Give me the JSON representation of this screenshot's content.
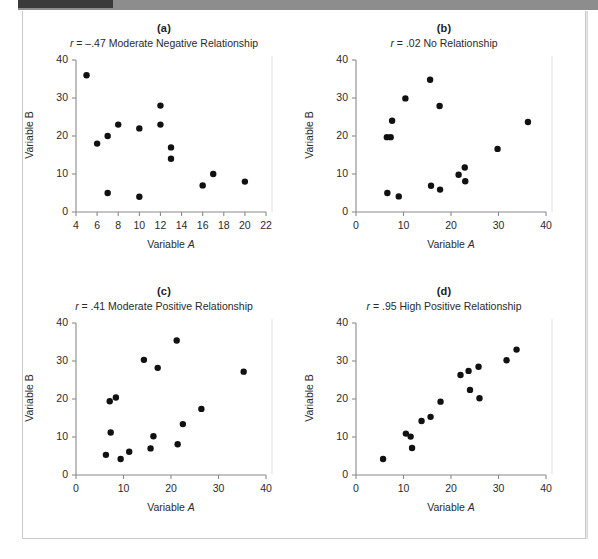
{
  "figure": {
    "panel_count": 4,
    "dot_color": "#111111",
    "axis_color": "#8a8a8a"
  },
  "chart_data": [
    {
      "type": "scatter",
      "panel": "(a)",
      "title": "r = –.47 Moderate Negative Relationship",
      "r_symbol": "r",
      "r_text": "= –.47 Moderate Negative Relationship",
      "r_value": -0.47,
      "relationship": "Moderate Negative Relationship",
      "xlabel": "Variable A",
      "ylabel": "Variable B",
      "xlim": [
        4,
        22
      ],
      "ylim": [
        0,
        40
      ],
      "xticks": [
        4,
        6,
        8,
        10,
        12,
        14,
        16,
        18,
        20,
        22
      ],
      "yticks": [
        0,
        10,
        20,
        30,
        40
      ],
      "grid": false,
      "legend": null,
      "points": [
        {
          "x": 5,
          "y": 36
        },
        {
          "x": 6,
          "y": 18
        },
        {
          "x": 7,
          "y": 20
        },
        {
          "x": 7,
          "y": 5
        },
        {
          "x": 8,
          "y": 23
        },
        {
          "x": 10,
          "y": 22
        },
        {
          "x": 10,
          "y": 4
        },
        {
          "x": 12,
          "y": 28
        },
        {
          "x": 12,
          "y": 23
        },
        {
          "x": 13,
          "y": 17
        },
        {
          "x": 13,
          "y": 14
        },
        {
          "x": 16,
          "y": 7
        },
        {
          "x": 17,
          "y": 10
        },
        {
          "x": 20,
          "y": 8
        }
      ]
    },
    {
      "type": "scatter",
      "panel": "(b)",
      "title": "r = .02 No Relationship",
      "r_symbol": "r",
      "r_text": "= .02 No Relationship",
      "r_value": 0.02,
      "relationship": "No Relationship",
      "xlabel": "Variable A",
      "ylabel": "Variable B",
      "xlim": [
        0,
        40
      ],
      "ylim": [
        0,
        40
      ],
      "xticks": [
        0,
        10,
        20,
        30,
        40
      ],
      "yticks": [
        0,
        10,
        20,
        30,
        40
      ],
      "grid": false,
      "legend": null,
      "points": [
        {
          "x": 6.5,
          "y": 19.7
        },
        {
          "x": 7.3,
          "y": 19.7
        },
        {
          "x": 7.6,
          "y": 24.0
        },
        {
          "x": 6.6,
          "y": 5.0
        },
        {
          "x": 9.0,
          "y": 4.1
        },
        {
          "x": 10.4,
          "y": 29.9
        },
        {
          "x": 15.6,
          "y": 34.8
        },
        {
          "x": 15.8,
          "y": 6.9
        },
        {
          "x": 17.6,
          "y": 27.9
        },
        {
          "x": 17.7,
          "y": 5.9
        },
        {
          "x": 21.6,
          "y": 9.8
        },
        {
          "x": 22.9,
          "y": 11.7
        },
        {
          "x": 23.0,
          "y": 8.1
        },
        {
          "x": 29.8,
          "y": 16.6
        },
        {
          "x": 36.2,
          "y": 23.7
        }
      ]
    },
    {
      "type": "scatter",
      "panel": "(c)",
      "title": "r = .41 Moderate Positive Relationship",
      "r_symbol": "r",
      "r_text": "= .41 Moderate Positive Relationship",
      "r_value": 0.41,
      "relationship": "Moderate Positive Relationship",
      "xlabel": "Variable A",
      "ylabel": "Variable B",
      "xlim": [
        0,
        40
      ],
      "ylim": [
        0,
        40
      ],
      "xticks": [
        0,
        10,
        20,
        30,
        40
      ],
      "yticks": [
        0,
        10,
        20,
        30,
        40
      ],
      "grid": false,
      "legend": null,
      "points": [
        {
          "x": 6.3,
          "y": 5.3
        },
        {
          "x": 7.1,
          "y": 19.4
        },
        {
          "x": 7.3,
          "y": 11.2
        },
        {
          "x": 8.4,
          "y": 20.4
        },
        {
          "x": 9.4,
          "y": 4.2
        },
        {
          "x": 11.2,
          "y": 6.1
        },
        {
          "x": 14.3,
          "y": 30.3
        },
        {
          "x": 15.7,
          "y": 7.0
        },
        {
          "x": 16.3,
          "y": 10.2
        },
        {
          "x": 17.2,
          "y": 28.2
        },
        {
          "x": 21.2,
          "y": 35.4
        },
        {
          "x": 21.4,
          "y": 8.1
        },
        {
          "x": 22.5,
          "y": 13.4
        },
        {
          "x": 26.4,
          "y": 17.4
        },
        {
          "x": 35.3,
          "y": 27.2
        }
      ]
    },
    {
      "type": "scatter",
      "panel": "(d)",
      "title": "r = .95 High Positive Relationship",
      "r_symbol": "r",
      "r_text": "= .95 High Positive Relationship",
      "r_value": 0.95,
      "relationship": "High Positive Relationship",
      "xlabel": "Variable A",
      "ylabel": "Variable B",
      "xlim": [
        0,
        40
      ],
      "ylim": [
        0,
        40
      ],
      "xticks": [
        0,
        10,
        20,
        30,
        40
      ],
      "yticks": [
        0,
        10,
        20,
        30,
        40
      ],
      "grid": false,
      "legend": null,
      "points": [
        {
          "x": 5.7,
          "y": 4.2
        },
        {
          "x": 10.5,
          "y": 10.9
        },
        {
          "x": 11.5,
          "y": 10.1
        },
        {
          "x": 11.8,
          "y": 7.1
        },
        {
          "x": 13.8,
          "y": 14.2
        },
        {
          "x": 15.7,
          "y": 15.3
        },
        {
          "x": 17.8,
          "y": 19.3
        },
        {
          "x": 22.0,
          "y": 26.3
        },
        {
          "x": 23.7,
          "y": 27.4
        },
        {
          "x": 24.0,
          "y": 22.4
        },
        {
          "x": 25.8,
          "y": 28.5
        },
        {
          "x": 26.0,
          "y": 20.2
        },
        {
          "x": 31.7,
          "y": 30.2
        },
        {
          "x": 33.8,
          "y": 33.0
        }
      ]
    }
  ]
}
